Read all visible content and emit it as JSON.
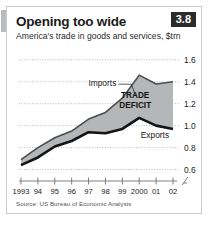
{
  "card": {
    "title": "Opening too wide",
    "subtitle": "America's trade in goods and services, $trn",
    "badge": "3.8",
    "source": "Source: US Bureau of Economic Analysis"
  },
  "colors": {
    "band": "#b4b6b8",
    "exports_line": "#141414",
    "imports_line": "#4a4c4e",
    "gridline": "#a8abad",
    "axis": "#6e7173",
    "badge_bg": "#2b2b2b",
    "accent": "#b9bcbe"
  },
  "chart_data": {
    "type": "area",
    "title": "Opening too wide",
    "subtitle": "America's trade in goods and services, $trn",
    "xlabel": "",
    "ylabel": "$trn",
    "categories": [
      "1993",
      "94",
      "95",
      "96",
      "97",
      "98",
      "99",
      "2000",
      "01",
      "02"
    ],
    "tick_labels": [
      "1993",
      "94",
      "95",
      "96",
      "97",
      "98",
      "99",
      "2000",
      "01",
      "02"
    ],
    "y_ticks": [
      "0.6",
      "0.8",
      "1.0",
      "1.2",
      "1.4",
      "1.6"
    ],
    "y_tick_values": [
      0.6,
      0.8,
      1.0,
      1.2,
      1.4,
      1.6
    ],
    "ylim": [
      0.55,
      1.68
    ],
    "axis_break": true,
    "grid": true,
    "legend_position": "inline-annotation",
    "series": [
      {
        "name": "Imports",
        "values": [
          0.69,
          0.8,
          0.89,
          0.95,
          1.06,
          1.12,
          1.25,
          1.46,
          1.38,
          1.4
        ]
      },
      {
        "name": "Exports",
        "values": [
          0.64,
          0.71,
          0.81,
          0.86,
          0.94,
          0.93,
          0.97,
          1.07,
          1.0,
          0.97
        ]
      }
    ],
    "annotations": [
      {
        "text": "Imports",
        "series": "Imports"
      },
      {
        "text": "Exports",
        "series": "Exports"
      },
      {
        "text": "TRADE",
        "kind": "band-label-line1"
      },
      {
        "text": "DEFICIT",
        "kind": "band-label-line2"
      }
    ]
  }
}
